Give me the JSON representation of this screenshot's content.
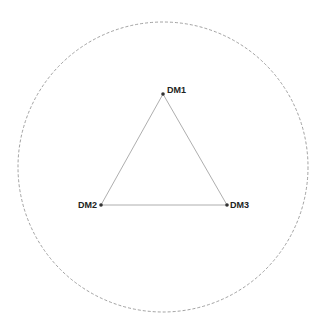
{
  "diagram": {
    "boundary": {
      "cx": 163,
      "cy": 167,
      "r": 145,
      "color": "#8a8a8a",
      "style": "dashed"
    },
    "edge_color": "#999999",
    "node_color": "#333333",
    "nodes": [
      {
        "id": "DM1",
        "label": "DM1",
        "x": 163,
        "y": 94
      },
      {
        "id": "DM2",
        "label": "DM2",
        "x": 101,
        "y": 205
      },
      {
        "id": "DM3",
        "label": "DM3",
        "x": 227,
        "y": 205
      }
    ],
    "edges": [
      [
        "DM1",
        "DM2"
      ],
      [
        "DM2",
        "DM3"
      ],
      [
        "DM3",
        "DM1"
      ]
    ]
  }
}
